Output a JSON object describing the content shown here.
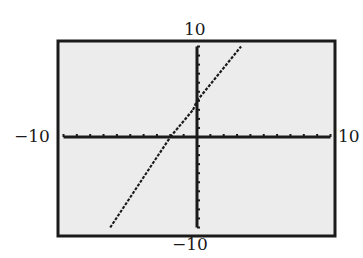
{
  "chart_data": {
    "type": "line",
    "title": "",
    "xlabel": "",
    "ylabel": "",
    "xlim": [
      -10,
      10
    ],
    "ylim": [
      -10,
      10
    ],
    "xscale_ticks": 1,
    "yscale_ticks": 1,
    "grid": false,
    "legend": null,
    "window_labels": {
      "xmin": "−10",
      "xmax": "10",
      "ymin": "−10",
      "ymax": "10"
    },
    "series": [
      {
        "name": "plotted-line",
        "note": "Approximate coordinates read from pixel positions; exact function not determinable from image",
        "points_approx": [
          {
            "x": -6.5,
            "y": -10
          },
          {
            "x": -2.0,
            "y": 0
          },
          {
            "x": -0.3,
            "y": 3
          },
          {
            "x": 0.0,
            "y": 4
          },
          {
            "x": 3.3,
            "y": 10
          }
        ]
      }
    ],
    "annotations": [
      "Possible break or kink near the y-axis around y≈3 to 4 — unclear whether this is a true discontinuity or a rendering artifact"
    ]
  },
  "colors": {
    "plot_background": "#ececec",
    "frame": "#1a1a1a",
    "axes": "#1a1a1a",
    "line": "#1a1a1a",
    "page_background": "#ffffff"
  }
}
